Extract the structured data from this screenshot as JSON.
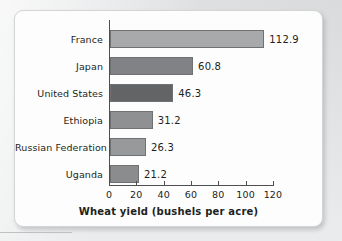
{
  "figure": {
    "axis_title": "Wheat yield (bushels per acre)"
  },
  "chart_data": {
    "type": "bar",
    "orientation": "horizontal",
    "title": "",
    "subtitle": "",
    "xlabel": "Wheat yield (bushels per acre)",
    "ylabel": "",
    "xlim": [
      0,
      120
    ],
    "xticks": [
      "0",
      "20",
      "40",
      "60",
      "80",
      "100",
      "120"
    ],
    "xtick_values": [
      0,
      20,
      40,
      60,
      80,
      100,
      120
    ],
    "grid": false,
    "legend": "none",
    "categories": [
      "France",
      "Japan",
      "United States",
      "Ethiopia",
      "Russian Federation",
      "Uganda"
    ],
    "values": [
      112.9,
      60.8,
      46.3,
      31.2,
      26.3,
      21.2
    ],
    "value_labels": [
      "112.9",
      "60.8",
      "46.3",
      "31.2",
      "26.3",
      "21.2"
    ],
    "bar_colors": [
      "#a7a9ab",
      "#808285",
      "#636466",
      "#8e9092",
      "#97999b",
      "#8a8c8e"
    ],
    "bar_edge_color": "#6f7173",
    "axis_color": "#4d4f51",
    "text_color": "#231f20",
    "background_color": "#fdfdfd"
  }
}
